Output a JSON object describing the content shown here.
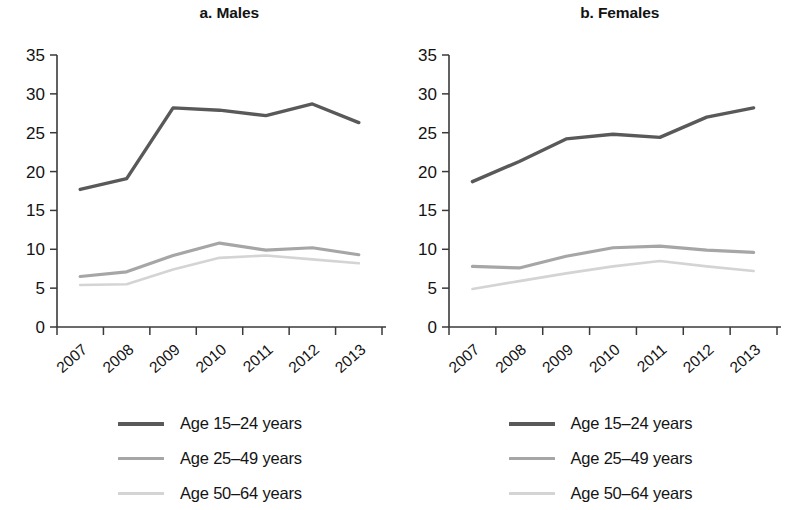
{
  "figure": {
    "panels": [
      {
        "id": "males",
        "title": "a. Males"
      },
      {
        "id": "females",
        "title": "b. Females"
      }
    ],
    "legend": {
      "entries": [
        {
          "label": "Age 15–24 years",
          "color": "#595959"
        },
        {
          "label": "Age 25–49 years",
          "color": "#a6a6a6"
        },
        {
          "label": "Age 50–64 years",
          "color": "#d4d4d4"
        }
      ]
    },
    "axis": {
      "y_ticks": [
        "0",
        "5",
        "10",
        "15",
        "20",
        "25",
        "30",
        "35"
      ],
      "x_ticks": [
        "2007",
        "2008",
        "2009",
        "2010",
        "2011",
        "2012",
        "2013"
      ]
    }
  },
  "chart_data": [
    {
      "type": "line",
      "title": "a. Males",
      "xlabel": "",
      "ylabel": "",
      "x": [
        "2007",
        "2008",
        "2009",
        "2010",
        "2011",
        "2012",
        "2013"
      ],
      "categories": [
        "2007",
        "2008",
        "2009",
        "2010",
        "2011",
        "2012",
        "2013"
      ],
      "ylim": [
        0,
        35
      ],
      "yticks": [
        0,
        5,
        10,
        15,
        20,
        25,
        30,
        35
      ],
      "grid": false,
      "legend_position": "bottom",
      "series": [
        {
          "name": "Age 15–24 years",
          "color": "#595959",
          "values": [
            17.7,
            19.1,
            28.2,
            27.9,
            27.2,
            28.7,
            26.3
          ]
        },
        {
          "name": "Age 25–49 years",
          "color": "#a6a6a6",
          "values": [
            6.5,
            7.1,
            9.2,
            10.8,
            9.9,
            10.2,
            9.3
          ]
        },
        {
          "name": "Age 50–64 years",
          "color": "#d4d4d4",
          "values": [
            5.4,
            5.5,
            7.4,
            8.9,
            9.2,
            8.7,
            8.2
          ]
        }
      ]
    },
    {
      "type": "line",
      "title": "b. Females",
      "xlabel": "",
      "ylabel": "",
      "x": [
        "2007",
        "2008",
        "2009",
        "2010",
        "2011",
        "2012",
        "2013"
      ],
      "categories": [
        "2007",
        "2008",
        "2009",
        "2010",
        "2011",
        "2012",
        "2013"
      ],
      "ylim": [
        0,
        35
      ],
      "yticks": [
        0,
        5,
        10,
        15,
        20,
        25,
        30,
        35
      ],
      "grid": false,
      "legend_position": "bottom",
      "series": [
        {
          "name": "Age 15–24 years",
          "color": "#595959",
          "values": [
            18.7,
            21.3,
            24.2,
            24.8,
            24.4,
            27.0,
            28.2
          ]
        },
        {
          "name": "Age 25–49 years",
          "color": "#a6a6a6",
          "values": [
            7.8,
            7.6,
            9.1,
            10.2,
            10.4,
            9.9,
            9.6
          ]
        },
        {
          "name": "Age 50–64 years",
          "color": "#d4d4d4",
          "values": [
            4.9,
            5.9,
            6.9,
            7.8,
            8.5,
            7.8,
            7.2
          ]
        }
      ]
    }
  ]
}
